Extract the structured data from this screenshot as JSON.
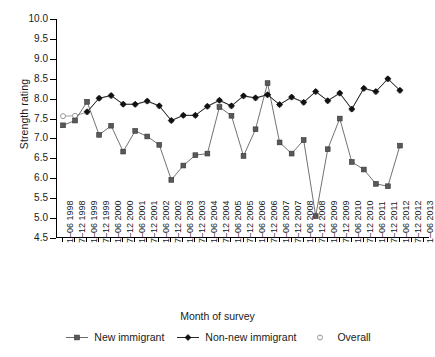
{
  "chart_data": {
    "type": "line",
    "title": "",
    "xlabel": "Month of survey",
    "ylabel": "Strength rating",
    "ylim": [
      4.5,
      10.0
    ],
    "yticks": [
      "10.0",
      "9.5",
      "9.0",
      "8.5",
      "8.0",
      "7.5",
      "7.0",
      "6.5",
      "6.0",
      "5.5",
      "5.0",
      "4.5"
    ],
    "ytick_values": [
      10.0,
      9.5,
      9.0,
      8.5,
      8.0,
      7.5,
      7.0,
      6.5,
      6.0,
      5.5,
      5.0,
      4.5
    ],
    "grid": false,
    "legend_position": "bottom",
    "categories": [
      "1–06 1998",
      "7–12 1998",
      "1–06 1999",
      "7–12 1999",
      "1–06 2000",
      "7–12 2000",
      "1–06 2001",
      "7–12 2001",
      "1–06 2002",
      "7–12 2002",
      "1–06 2003",
      "7–12 2003",
      "1–06 2004",
      "7–12 2004",
      "1–06 2005",
      "7–12 2005",
      "1–06 2006",
      "7–12 2006",
      "1–06 2007",
      "7–12 2007",
      "1–06 2008",
      "7–12 2008",
      "1–06 2009",
      "7–12 2009",
      "1–06 2010",
      "7–12 2010",
      "1–06 2011",
      "7–12 2011",
      "1–06 2012",
      "7–12 2012",
      "1–06 2013"
    ],
    "series": [
      {
        "name": "New immigrant",
        "marker": "square",
        "color": "#595959",
        "values": [
          7.33,
          7.45,
          7.92,
          7.09,
          7.32,
          6.67,
          7.19,
          7.05,
          6.84,
          5.96,
          6.32,
          6.58,
          6.62,
          7.79,
          7.57,
          6.56,
          7.23,
          8.39,
          6.9,
          6.62,
          6.96,
          5.05,
          6.73,
          7.5,
          6.41,
          6.22,
          5.86,
          5.8,
          6.82,
          null,
          null
        ]
      },
      {
        "name": "Non-new immigrant",
        "marker": "diamond",
        "color": "#111111",
        "values": [
          null,
          null,
          7.67,
          8.01,
          8.08,
          7.86,
          7.86,
          7.94,
          7.82,
          7.45,
          7.58,
          7.58,
          7.81,
          7.96,
          7.82,
          8.07,
          8.02,
          8.1,
          7.85,
          8.04,
          7.91,
          8.18,
          7.95,
          8.14,
          7.74,
          8.26,
          8.18,
          8.5,
          8.21,
          null,
          null
        ]
      },
      {
        "name": "Overall",
        "marker": "circle",
        "color": "#8c8c8c",
        "values": [
          7.56,
          7.57,
          7.66,
          8.01,
          8.07,
          7.86,
          7.85,
          7.93,
          7.81,
          7.45,
          7.58,
          7.58,
          7.8,
          7.95,
          7.81,
          8.06,
          8.01,
          8.09,
          7.85,
          8.03,
          7.9,
          8.17,
          7.94,
          8.13,
          7.73,
          8.25,
          8.17,
          8.49,
          8.2,
          null,
          null
        ]
      }
    ]
  },
  "legend": {
    "items": [
      {
        "label": "New immigrant",
        "marker": "square"
      },
      {
        "label": "Non-new immigrant",
        "marker": "diamond"
      },
      {
        "label": "Overall",
        "marker": "circle"
      }
    ]
  }
}
